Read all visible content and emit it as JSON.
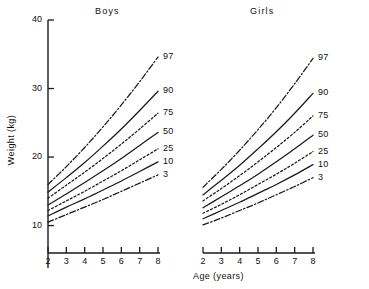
{
  "figure": {
    "background": "#ffffff",
    "ink": "#1a1a1a"
  },
  "panels": {
    "boys": {
      "title": "Boys"
    },
    "girls": {
      "title": "Girls"
    }
  },
  "axes": {
    "y": {
      "title": "Weight (kg)",
      "ticks": [
        "40",
        "30",
        "20",
        "10"
      ],
      "tick_values": [
        40,
        30,
        20,
        10
      ],
      "range": [
        6,
        40
      ]
    },
    "x": {
      "title": "Age (years)",
      "ticks": [
        "2",
        "3",
        "4",
        "5",
        "6",
        "7",
        "8"
      ],
      "tick_values": [
        2,
        3,
        4,
        5,
        6,
        7,
        8
      ],
      "range": [
        2,
        8
      ]
    }
  },
  "legend_labels": {
    "p97": "97",
    "p90": "90",
    "p75": "75",
    "p50": "50",
    "p25": "25",
    "p10": "10",
    "p3": "3"
  },
  "chart_data": {
    "type": "line",
    "xlabel": "Age (years)",
    "ylabel": "Weight (kg)",
    "x": [
      2,
      3,
      4,
      5,
      6,
      7,
      8
    ],
    "xlim": [
      2,
      8
    ],
    "ylim": [
      6,
      40
    ],
    "grid": false,
    "legend_position": "right-of-curve-ends",
    "panels": [
      {
        "name": "Boys",
        "series": [
          {
            "name": "97",
            "style": "dash-dot",
            "values": [
              16.0,
              18.6,
              21.4,
              24.4,
              27.6,
              31.0,
              34.6
            ]
          },
          {
            "name": "90",
            "style": "solid",
            "values": [
              14.9,
              17.0,
              19.2,
              21.6,
              24.1,
              26.8,
              29.6
            ]
          },
          {
            "name": "75",
            "style": "dotted",
            "values": [
              14.0,
              15.9,
              17.8,
              19.8,
              21.9,
              24.1,
              26.4
            ]
          },
          {
            "name": "50",
            "style": "solid",
            "values": [
              13.0,
              14.6,
              16.3,
              18.0,
              19.8,
              21.7,
              23.6
            ]
          },
          {
            "name": "25",
            "style": "dotted",
            "values": [
              12.2,
              13.6,
              15.0,
              16.5,
              18.0,
              19.6,
              21.2
            ]
          },
          {
            "name": "10",
            "style": "solid",
            "values": [
              11.4,
              12.7,
              13.9,
              15.2,
              16.5,
              17.9,
              19.3
            ]
          },
          {
            "name": "3",
            "style": "dash-dot",
            "values": [
              10.5,
              11.6,
              12.7,
              13.8,
              15.0,
              16.2,
              17.4
            ]
          }
        ]
      },
      {
        "name": "Girls",
        "series": [
          {
            "name": "97",
            "style": "dash-dot",
            "values": [
              15.6,
              18.2,
              21.0,
              24.0,
              27.2,
              30.7,
              34.4
            ]
          },
          {
            "name": "90",
            "style": "solid",
            "values": [
              14.5,
              16.6,
              18.8,
              21.2,
              23.7,
              26.4,
              29.3
            ]
          },
          {
            "name": "75",
            "style": "dotted",
            "values": [
              13.6,
              15.4,
              17.3,
              19.3,
              21.4,
              23.6,
              26.0
            ]
          },
          {
            "name": "50",
            "style": "solid",
            "values": [
              12.6,
              14.2,
              15.8,
              17.5,
              19.3,
              21.2,
              23.2
            ]
          },
          {
            "name": "25",
            "style": "dotted",
            "values": [
              11.8,
              13.1,
              14.5,
              16.0,
              17.5,
              19.1,
              20.8
            ]
          },
          {
            "name": "10",
            "style": "solid",
            "values": [
              11.0,
              12.2,
              13.4,
              14.7,
              16.0,
              17.4,
              18.9
            ]
          },
          {
            "name": "3",
            "style": "dash-dot",
            "values": [
              10.1,
              11.1,
              12.2,
              13.3,
              14.5,
              15.7,
              17.0
            ]
          }
        ]
      }
    ]
  }
}
